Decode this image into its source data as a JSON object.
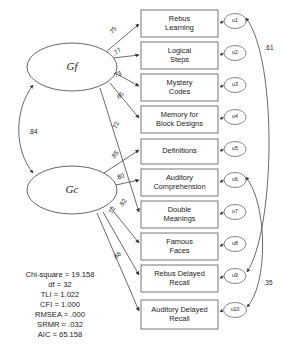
{
  "diagram": {
    "type": "path-diagram",
    "factors": [
      {
        "id": "Gf",
        "label": "Gf",
        "cx": 72,
        "cy": 67,
        "rx": 45,
        "ry": 24
      },
      {
        "id": "Gc",
        "label": "Gc",
        "cx": 72,
        "cy": 190,
        "rx": 45,
        "ry": 24
      }
    ],
    "factor_correlation": {
      "from": "Gf",
      "to": "Gc",
      "value": ".84",
      "label_x": 33,
      "label_y": 132
    },
    "indicators": [
      {
        "id": "i1",
        "lines": [
          "Rebus",
          "Learning"
        ],
        "x": 141,
        "y": 10,
        "w": 77,
        "h": 27
      },
      {
        "id": "i2",
        "lines": [
          "Logical",
          "Steps"
        ],
        "x": 141,
        "y": 42,
        "w": 77,
        "h": 27
      },
      {
        "id": "i3",
        "lines": [
          "Mystery",
          "Codes"
        ],
        "x": 141,
        "y": 74,
        "w": 77,
        "h": 27
      },
      {
        "id": "i4",
        "lines": [
          "Memory for",
          "Block Designs"
        ],
        "x": 141,
        "y": 106,
        "w": 77,
        "h": 27
      },
      {
        "id": "i5",
        "lines": [
          "Definitions"
        ],
        "x": 141,
        "y": 139,
        "w": 77,
        "h": 25
      },
      {
        "id": "i6",
        "lines": [
          "Auditory",
          "Comprehension"
        ],
        "x": 141,
        "y": 169,
        "w": 77,
        "h": 27
      },
      {
        "id": "i7",
        "lines": [
          "Double",
          "Meanings"
        ],
        "x": 141,
        "y": 201,
        "w": 77,
        "h": 27
      },
      {
        "id": "i8",
        "lines": [
          "Famous",
          "Faces"
        ],
        "x": 141,
        "y": 233,
        "w": 77,
        "h": 27
      },
      {
        "id": "i9",
        "lines": [
          "Rebus Delayed",
          "Recall"
        ],
        "x": 141,
        "y": 265,
        "w": 77,
        "h": 27
      },
      {
        "id": "i10",
        "lines": [
          "Auditory Delayed",
          "Recall"
        ],
        "x": 141,
        "y": 300,
        "w": 77,
        "h": 29
      }
    ],
    "residuals": [
      {
        "id": "u1",
        "label": "u1",
        "cx": 235,
        "cy": 21,
        "rx": 11,
        "ry": 7.5
      },
      {
        "id": "u2",
        "label": "u2",
        "cx": 235,
        "cy": 53,
        "rx": 11,
        "ry": 7.5
      },
      {
        "id": "u3",
        "label": "u3",
        "cx": 235,
        "cy": 85,
        "rx": 11,
        "ry": 7.5
      },
      {
        "id": "u4",
        "label": "u4",
        "cx": 235,
        "cy": 117,
        "rx": 11,
        "ry": 7.5
      },
      {
        "id": "u5",
        "label": "u5",
        "cx": 235,
        "cy": 149,
        "rx": 11,
        "ry": 7.5
      },
      {
        "id": "u6",
        "label": "u6",
        "cx": 235,
        "cy": 180,
        "rx": 11,
        "ry": 7.5
      },
      {
        "id": "u7",
        "label": "u7",
        "cx": 235,
        "cy": 212,
        "rx": 11,
        "ry": 7.5
      },
      {
        "id": "u8",
        "label": "u8",
        "cx": 235,
        "cy": 244,
        "rx": 11,
        "ry": 7.5
      },
      {
        "id": "u9",
        "label": "u9",
        "cx": 235,
        "cy": 276,
        "rx": 11,
        "ry": 7.5
      },
      {
        "id": "u10",
        "label": "u10",
        "cx": 235,
        "cy": 310,
        "rx": 11.5,
        "ry": 7.5
      }
    ],
    "loadings": [
      {
        "from": "Gf",
        "to": "i1",
        "value": ".75",
        "label_x": 113,
        "label_y": 31,
        "rotate": -52
      },
      {
        "from": "Gf",
        "to": "i2",
        "value": ".77",
        "label_x": 117,
        "label_y": 52,
        "rotate": -35
      },
      {
        "from": "Gf",
        "to": "i3",
        "value": ".73",
        "label_x": 117,
        "label_y": 75,
        "rotate": -22
      },
      {
        "from": "Gf",
        "to": "i4",
        "value": ".65",
        "label_x": 120,
        "label_y": 96,
        "rotate": -43
      },
      {
        "from": "Gf",
        "to": "i7",
        "value": ".72",
        "label_x": 116,
        "label_y": 126,
        "rotate": -72
      },
      {
        "from": "Gc",
        "to": "i5",
        "value": ".85",
        "label_x": 115,
        "label_y": 155,
        "rotate": -50
      },
      {
        "from": "Gc",
        "to": "i6",
        "value": ".80",
        "label_x": 120,
        "label_y": 177,
        "rotate": -22
      },
      {
        "from": "Gc",
        "to": "i8",
        "value": ".82",
        "label_x": 123,
        "label_y": 203,
        "rotate": -58
      },
      {
        "from": "Gc",
        "to": "i9",
        "value": ".72",
        "label_x": 112,
        "label_y": 211,
        "rotate": -63
      },
      {
        "from": "Gc",
        "to": "i10",
        "value": ".68",
        "label_x": 117,
        "label_y": 256,
        "rotate": -40
      }
    ],
    "residual_correlations": [
      {
        "from": "u1",
        "to": "u9",
        "value": ".61",
        "label_x": 269,
        "label_y": 48
      },
      {
        "from": "u6",
        "to": "u10",
        "value": ".35",
        "label_x": 268,
        "label_y": 283
      }
    ]
  },
  "fit_statistics": {
    "lines": [
      "Chi-square = 19.158",
      "df = 32",
      "TLI = 1.022",
      "CFI = 1.000",
      "RMSEA = .000",
      "SRMR = .032",
      "AIC = 65.158"
    ],
    "x": 60,
    "y_start": 275,
    "line_height": 10
  }
}
